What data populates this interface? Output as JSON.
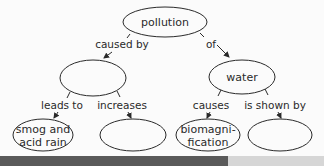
{
  "concept_map": {
    "root": {
      "label": "pollution"
    },
    "links_from_root": [
      {
        "label": "caused by"
      },
      {
        "label": "of"
      }
    ],
    "middle_nodes": [
      {
        "label": ""
      },
      {
        "label": "water"
      }
    ],
    "links_from_middle": [
      {
        "label": "leads to"
      },
      {
        "label": "increases"
      },
      {
        "label": "causes"
      },
      {
        "label": "is shown by"
      }
    ],
    "leaf_nodes": [
      {
        "line1": "smog and",
        "line2": "acid rain"
      },
      {
        "line1": "",
        "line2": ""
      },
      {
        "line1": "biomagni-",
        "line2": "fication"
      },
      {
        "line1": "",
        "line2": ""
      }
    ]
  },
  "colors": {
    "stroke": "#2a2a2a",
    "background": "#fbfbfb",
    "bottom_bar_dark": "#5a5a5a",
    "bottom_bar_light": "#d6d6d6"
  }
}
